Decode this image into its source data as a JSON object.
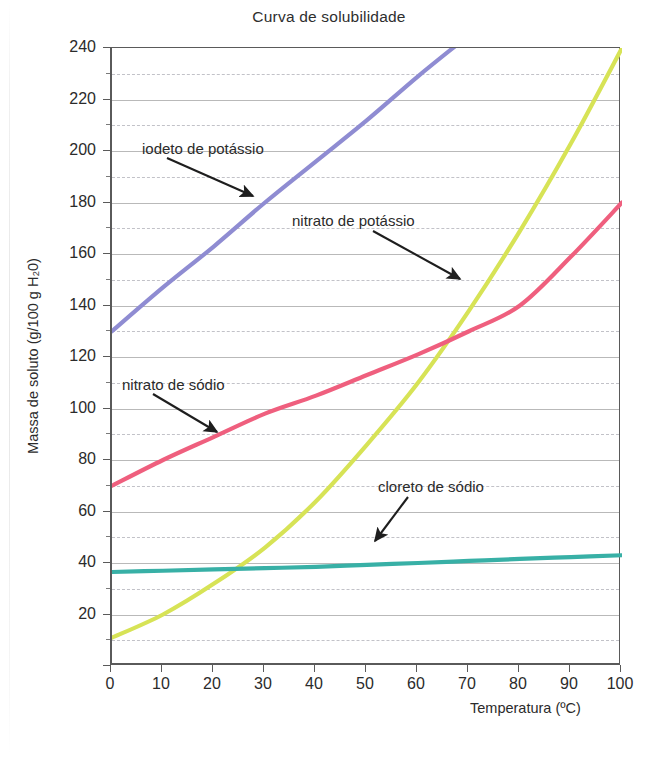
{
  "chart_data": {
    "type": "line",
    "title": "Curva de solubilidade",
    "xlabel": "Temperatura (ºC)",
    "ylabel": "Massa de soluto (g/100 g H₂0)",
    "xlim": [
      0,
      100
    ],
    "ylim": [
      0,
      240
    ],
    "xticks": [
      0,
      10,
      20,
      30,
      40,
      50,
      60,
      70,
      80,
      90,
      100
    ],
    "yticks": [
      0,
      20,
      40,
      60,
      80,
      100,
      120,
      140,
      160,
      180,
      200,
      220,
      240
    ],
    "y_minor_ticks": [
      10,
      30,
      50,
      70,
      90,
      110,
      130,
      150,
      170,
      190,
      210,
      230
    ],
    "grid": true,
    "legend": "none (inline arrow annotations)",
    "x": [
      0,
      10,
      20,
      30,
      40,
      50,
      60,
      70,
      80,
      90,
      100
    ],
    "series": [
      {
        "name": "iodeto de potássio",
        "color": "#8f8cd2",
        "values": [
          130,
          147,
          163,
          180,
          196,
          212,
          229,
          245,
          261,
          278,
          294
        ],
        "note": "reta ascendente; sai pelo topo do gráfico (240) em ~65 ºC"
      },
      {
        "name": "nitrato de potássio",
        "color": "#d7e356",
        "values": [
          11,
          20,
          32,
          46,
          64,
          86,
          110,
          138,
          169,
          203,
          240
        ],
        "note": "curva exponencial; cruza o nitrato de sódio em ~65 ºC / 127 g"
      },
      {
        "name": "nitrato de sódio",
        "color": "#ef5f7e",
        "values": [
          70,
          80,
          89,
          98,
          105,
          113,
          121,
          130,
          140,
          159,
          180
        ],
        "note": "curva suave ascendente"
      },
      {
        "name": "cloreto de sódio",
        "color": "#38b0a6",
        "values": [
          36.5,
          37,
          37.5,
          38,
          38.5,
          39.3,
          40,
          40.8,
          41.6,
          42.3,
          43
        ],
        "note": "praticamente horizontal"
      }
    ],
    "annotations": [
      {
        "text": "iodeto de potássio",
        "points_to": "iodeto de potássio"
      },
      {
        "text": "nitrato de potássio",
        "points_to": "nitrato de potássio"
      },
      {
        "text": "nitrato de sódio",
        "points_to": "nitrato de sódio"
      },
      {
        "text": "cloreto de sódio",
        "points_to": "cloreto de sódio"
      }
    ]
  },
  "axis": {
    "x_tick_labels": [
      "0",
      "10",
      "20",
      "30",
      "40",
      "50",
      "60",
      "70",
      "80",
      "90",
      "100"
    ],
    "y_tick_labels": [
      "0",
      "20",
      "40",
      "60",
      "80",
      "100",
      "120",
      "140",
      "160",
      "180",
      "200",
      "220",
      "240"
    ]
  },
  "colors": {
    "iodeto_potassio": "#8f8cd2",
    "nitrato_potassio": "#d7e356",
    "nitrato_sodio": "#ef5f7e",
    "cloreto_sodio": "#38b0a6",
    "axis": "#5a5a5a",
    "grid_major": "#b9b9b9",
    "grid_minor": "#c2c2c8",
    "text": "#2b2b2b",
    "background": "#ffffff"
  }
}
